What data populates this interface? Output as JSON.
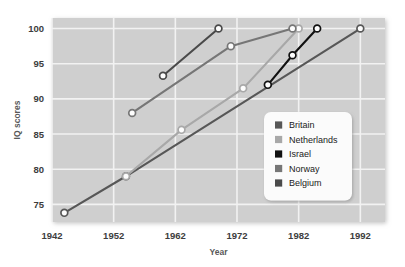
{
  "chart_data": {
    "type": "line",
    "title": "",
    "xlabel": "Year",
    "ylabel": "IQ scores",
    "xlim": [
      1942,
      1996
    ],
    "ylim": [
      72.5,
      101.5
    ],
    "xticks": [
      1942,
      1952,
      1962,
      1972,
      1982,
      1992
    ],
    "yticks": [
      75,
      80,
      85,
      90,
      95,
      100
    ],
    "grid": true,
    "legend_position": "center-right",
    "markers": "open-circle",
    "series": [
      {
        "name": "Britain",
        "color": "#575757",
        "points": [
          {
            "x": 1944,
            "y": 73.8
          },
          {
            "x": 1954,
            "y": 79.0
          },
          {
            "x": 1992,
            "y": 100.0
          }
        ]
      },
      {
        "name": "Netherlands",
        "color": "#a8a8a8",
        "points": [
          {
            "x": 1954,
            "y": 79.0
          },
          {
            "x": 1963,
            "y": 85.6
          },
          {
            "x": 1973,
            "y": 91.5
          },
          {
            "x": 1982,
            "y": 100.0
          }
        ]
      },
      {
        "name": "Israel",
        "color": "#111111",
        "points": [
          {
            "x": 1977,
            "y": 92.0
          },
          {
            "x": 1981,
            "y": 96.2
          },
          {
            "x": 1985,
            "y": 100.0
          }
        ]
      },
      {
        "name": "Norway",
        "color": "#767676",
        "points": [
          {
            "x": 1955,
            "y": 88.0
          },
          {
            "x": 1971,
            "y": 97.5
          },
          {
            "x": 1981,
            "y": 100.0
          }
        ]
      },
      {
        "name": "Belgium",
        "color": "#4a4a4a",
        "points": [
          {
            "x": 1960,
            "y": 93.3
          },
          {
            "x": 1969,
            "y": 100.0
          }
        ]
      }
    ],
    "plot_background": "#cfcfcf",
    "grid_color": "#f2f2f2",
    "marker_fill": "#fdfdfd"
  },
  "legend": {
    "items": [
      {
        "label": "Britain",
        "swatch": "#575757"
      },
      {
        "label": "Netherlands",
        "swatch": "#a8a8a8"
      },
      {
        "label": "Israel",
        "swatch": "#111111"
      },
      {
        "label": "Norway",
        "swatch": "#767676"
      },
      {
        "label": "Belgium",
        "swatch": "#4a4a4a"
      }
    ]
  }
}
